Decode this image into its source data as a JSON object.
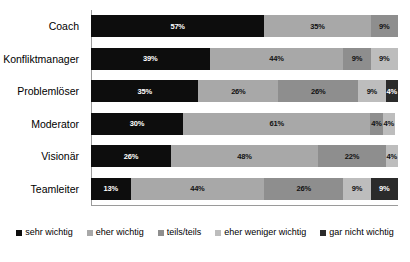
{
  "chart_data": {
    "type": "bar",
    "subtype": "stacked-horizontal-100",
    "title": "",
    "subtitle": "",
    "xlabel": "",
    "ylabel": "",
    "xlim": [
      0,
      100
    ],
    "grid": false,
    "legend_position": "bottom",
    "value_suffix": "%",
    "categories": [
      "Coach",
      "Konfliktmanager",
      "Problemlöser",
      "Moderator",
      "Visionär",
      "Teamleiter"
    ],
    "series": [
      {
        "name": "sehr wichtig",
        "color": "#0d0d0d",
        "label_color": "light",
        "values": [
          57,
          39,
          35,
          30,
          26,
          13
        ]
      },
      {
        "name": "eher wichtig",
        "color": "#a8a8a8",
        "label_color": "dark",
        "values": [
          35,
          44,
          26,
          61,
          48,
          44
        ]
      },
      {
        "name": "teils/teils",
        "color": "#8e8e8e",
        "label_color": "dark",
        "values": [
          9,
          9,
          26,
          4,
          22,
          26
        ]
      },
      {
        "name": "eher weniger wichtig",
        "color": "#bdbdbd",
        "label_color": "dark",
        "values": [
          0,
          9,
          9,
          4,
          4,
          9
        ]
      },
      {
        "name": "gar nicht wichtig",
        "color": "#2b2b2b",
        "label_color": "light",
        "values": [
          0,
          0,
          4,
          0,
          0,
          9
        ]
      }
    ],
    "rows": [
      {
        "category": "Coach",
        "segments": [
          {
            "series": "sehr wichtig",
            "value": 57,
            "label": "57%",
            "color": "#0d0d0d",
            "label_color": "light"
          },
          {
            "series": "eher wichtig",
            "value": 35,
            "label": "35%",
            "color": "#a8a8a8",
            "label_color": "dark"
          },
          {
            "series": "teils/teils",
            "value": 9,
            "label": "9%",
            "color": "#8e8e8e",
            "label_color": "dark"
          }
        ]
      },
      {
        "category": "Konfliktmanager",
        "segments": [
          {
            "series": "sehr wichtig",
            "value": 39,
            "label": "39%",
            "color": "#0d0d0d",
            "label_color": "light"
          },
          {
            "series": "eher wichtig",
            "value": 44,
            "label": "44%",
            "color": "#a8a8a8",
            "label_color": "dark"
          },
          {
            "series": "teils/teils",
            "value": 9,
            "label": "9%",
            "color": "#8e8e8e",
            "label_color": "dark"
          },
          {
            "series": "eher weniger wichtig",
            "value": 9,
            "label": "9%",
            "color": "#bdbdbd",
            "label_color": "dark"
          }
        ]
      },
      {
        "category": "Problemlöser",
        "segments": [
          {
            "series": "sehr wichtig",
            "value": 35,
            "label": "35%",
            "color": "#0d0d0d",
            "label_color": "light"
          },
          {
            "series": "eher wichtig",
            "value": 26,
            "label": "26%",
            "color": "#a8a8a8",
            "label_color": "dark"
          },
          {
            "series": "teils/teils",
            "value": 26,
            "label": "26%",
            "color": "#8e8e8e",
            "label_color": "dark"
          },
          {
            "series": "eher weniger wichtig",
            "value": 9,
            "label": "9%",
            "color": "#bdbdbd",
            "label_color": "dark"
          },
          {
            "series": "gar nicht wichtig",
            "value": 4,
            "label": "4%",
            "color": "#2b2b2b",
            "label_color": "light"
          }
        ]
      },
      {
        "category": "Moderator",
        "segments": [
          {
            "series": "sehr wichtig",
            "value": 30,
            "label": "30%",
            "color": "#0d0d0d",
            "label_color": "light"
          },
          {
            "series": "eher wichtig",
            "value": 61,
            "label": "61%",
            "color": "#a8a8a8",
            "label_color": "dark"
          },
          {
            "series": "teils/teils",
            "value": 4,
            "label": "4%",
            "color": "#8e8e8e",
            "label_color": "dark"
          },
          {
            "series": "eher weniger wichtig",
            "value": 4,
            "label": "4%",
            "color": "#bdbdbd",
            "label_color": "dark"
          }
        ]
      },
      {
        "category": "Visionär",
        "segments": [
          {
            "series": "sehr wichtig",
            "value": 26,
            "label": "26%",
            "color": "#0d0d0d",
            "label_color": "light"
          },
          {
            "series": "eher wichtig",
            "value": 48,
            "label": "48%",
            "color": "#a8a8a8",
            "label_color": "dark"
          },
          {
            "series": "teils/teils",
            "value": 22,
            "label": "22%",
            "color": "#8e8e8e",
            "label_color": "dark"
          },
          {
            "series": "eher weniger wichtig",
            "value": 4,
            "label": "4%",
            "color": "#bdbdbd",
            "label_color": "dark"
          }
        ]
      },
      {
        "category": "Teamleiter",
        "segments": [
          {
            "series": "sehr wichtig",
            "value": 13,
            "label": "13%",
            "color": "#0d0d0d",
            "label_color": "light"
          },
          {
            "series": "eher wichtig",
            "value": 44,
            "label": "44%",
            "color": "#a8a8a8",
            "label_color": "dark"
          },
          {
            "series": "teils/teils",
            "value": 26,
            "label": "26%",
            "color": "#8e8e8e",
            "label_color": "dark"
          },
          {
            "series": "eher weniger wichtig",
            "value": 9,
            "label": "9%",
            "color": "#bdbdbd",
            "label_color": "dark"
          },
          {
            "series": "gar nicht wichtig",
            "value": 9,
            "label": "9%",
            "color": "#2b2b2b",
            "label_color": "light"
          }
        ]
      }
    ],
    "legend": [
      {
        "label": "sehr wichtig",
        "color": "#0d0d0d"
      },
      {
        "label": "eher wichtig",
        "color": "#a8a8a8"
      },
      {
        "label": "teils/teils",
        "color": "#8e8e8e"
      },
      {
        "label": "eher weniger wichtig",
        "color": "#bdbdbd"
      },
      {
        "label": "gar nicht wichtig",
        "color": "#2b2b2b"
      }
    ]
  },
  "colors": {
    "background": "#ffffff",
    "axis": "#9a9a9a",
    "text": "#000000"
  }
}
